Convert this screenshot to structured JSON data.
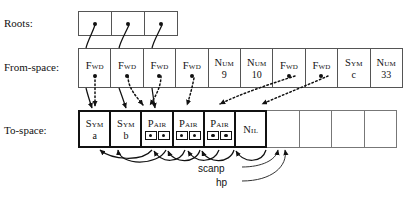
{
  "diagram": {
    "rows": [
      {
        "id": "roots",
        "label": "Roots:"
      },
      {
        "id": "from_space",
        "label": "From-space:"
      },
      {
        "id": "to_space",
        "label": "To-space:"
      }
    ]
  },
  "roots": {
    "label": "Roots:",
    "cells": [
      {
        "kind": "pointer",
        "marker": "dot"
      },
      {
        "kind": "pointer",
        "marker": "dot"
      },
      {
        "kind": "pointer",
        "marker": "dot"
      }
    ]
  },
  "from_space": {
    "label": "From-space:",
    "cells": [
      {
        "tag": "Fwd",
        "value": "",
        "marker": "dot"
      },
      {
        "tag": "Fwd",
        "value": "",
        "marker": "dot"
      },
      {
        "tag": "Fwd",
        "value": "",
        "marker": "dot"
      },
      {
        "tag": "Fwd",
        "value": "",
        "marker": "dot"
      },
      {
        "tag": "Num",
        "value": "9",
        "marker": "none"
      },
      {
        "tag": "Num",
        "value": "10",
        "marker": "none"
      },
      {
        "tag": "Fwd",
        "value": "",
        "marker": "dot"
      },
      {
        "tag": "Fwd",
        "value": "",
        "marker": "dot"
      },
      {
        "tag": "Sym",
        "value": "c",
        "marker": "none"
      },
      {
        "tag": "Num",
        "value": "33",
        "marker": "none"
      }
    ]
  },
  "to_space": {
    "label": "To-space:",
    "cells": [
      {
        "tag": "Sym",
        "value": "a",
        "marker": "none",
        "state": "live"
      },
      {
        "tag": "Sym",
        "value": "b",
        "marker": "none",
        "state": "live"
      },
      {
        "tag": "Pair",
        "value": "",
        "marker": "pair",
        "state": "live"
      },
      {
        "tag": "Pair",
        "value": "",
        "marker": "pair",
        "state": "live"
      },
      {
        "tag": "Pair",
        "value": "",
        "marker": "pair",
        "state": "live"
      },
      {
        "tag": "Nil",
        "value": "",
        "marker": "none",
        "state": "live"
      },
      {
        "tag": "",
        "value": "",
        "marker": "none",
        "state": "empty"
      },
      {
        "tag": "",
        "value": "",
        "marker": "none",
        "state": "empty"
      },
      {
        "tag": "",
        "value": "",
        "marker": "none",
        "state": "empty"
      },
      {
        "tag": "",
        "value": "",
        "marker": "none",
        "state": "empty"
      }
    ]
  },
  "pointers": {
    "scanp": "scanp",
    "hp": "hp"
  },
  "colors": {
    "ink": "#111111",
    "cell_border": "#555555",
    "live_border": "#111111",
    "background": "#ffffff"
  }
}
